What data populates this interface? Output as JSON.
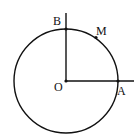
{
  "diagram": {
    "type": "unit-circle-geometry",
    "points": [
      {
        "id": "O",
        "label": "O",
        "role": "center"
      },
      {
        "id": "A",
        "label": "A",
        "role": "intersection of circle and horizontal ray"
      },
      {
        "id": "B",
        "label": "B",
        "role": "intersection of circle and vertical ray"
      },
      {
        "id": "M",
        "label": "M",
        "role": "point on arc AB"
      }
    ],
    "elements": [
      {
        "id": "circle",
        "description": "circle centered at O"
      },
      {
        "id": "ray-OA",
        "description": "horizontal ray from O through A"
      },
      {
        "id": "ray-OB",
        "description": "vertical ray from O through B"
      }
    ]
  }
}
